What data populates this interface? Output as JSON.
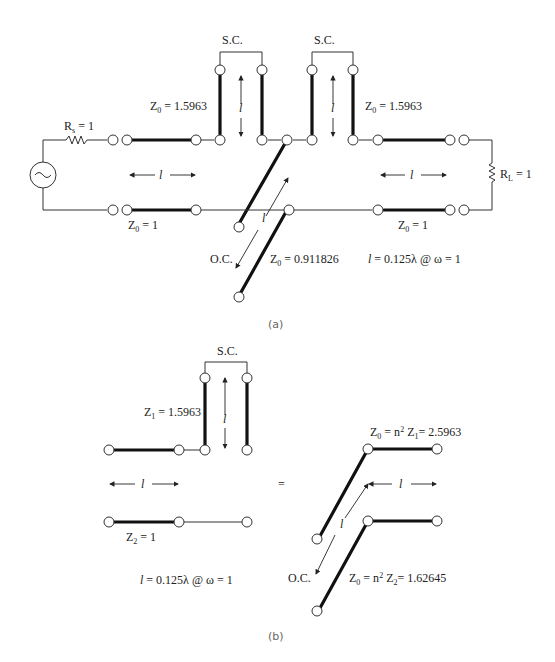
{
  "figure_a": {
    "caption": "(a)",
    "source_resistor": "R",
    "source_resistor_sub": "s",
    "source_resistor_value": " = 1",
    "load_resistor": "R",
    "load_resistor_sub": "L",
    "load_resistor_value": " = 1",
    "stub_left_label": "S.C.",
    "stub_right_label": "S.C.",
    "stub_left_z": "Z",
    "stub_left_z_sub": "0",
    "stub_left_z_value": " = 1.5963",
    "stub_right_z": "Z",
    "stub_right_z_sub": "0",
    "stub_right_z_value": " = 1.5963",
    "line_left_z": "Z",
    "line_left_z_sub": "0",
    "line_left_z_value": " = 1",
    "line_right_z": "Z",
    "line_right_z_sub": "0",
    "line_right_z_value": " = 1",
    "oc_label": "O.C.",
    "coupled_z": "Z",
    "coupled_z_sub": "0",
    "coupled_z_value": " = 0.911826",
    "length_symbol": "l",
    "length_spec": " = 0.125λ @ ω = 1"
  },
  "figure_b": {
    "caption": "(b)",
    "stub_label": "S.C.",
    "z1": "Z",
    "z1_sub": "1",
    "z1_value": " = 1.5963",
    "z2": "Z",
    "z2_sub": "2",
    "z2_value": " = 1",
    "equals": "=",
    "top_z": "Z",
    "top_z_sub": "0",
    "top_z_mid": " = n",
    "top_z_sup": "2",
    "top_z_z": " Z",
    "top_z_z_sub": "1",
    "top_z_value": "= 2.5963",
    "bottom_z": "Z",
    "bottom_z_sub": "0",
    "bottom_z_mid": " = n",
    "bottom_z_sup": "2",
    "bottom_z_z": " Z",
    "bottom_z_z_sub": "2",
    "bottom_z_value": "= 1.62645",
    "oc_label": "O.C.",
    "length_symbol": "l",
    "length_spec": " = 0.125λ @ ω = 1"
  }
}
